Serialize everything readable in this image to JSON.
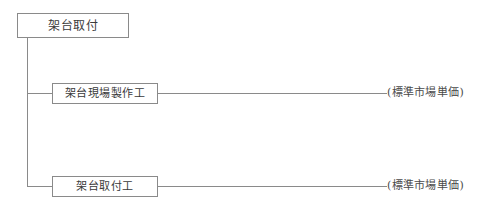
{
  "diagram": {
    "type": "tree",
    "root": {
      "id": "node-root",
      "label": "架台取付"
    },
    "children": [
      {
        "id": "node-fab",
        "label": "架台現場製作工",
        "annotation": "(標準市場単価)"
      },
      {
        "id": "node-install",
        "label": "架台取付工",
        "annotation": "(標準市場単価)"
      }
    ],
    "colors": {
      "box_border": "#8a8a8a",
      "line": "#8a8a8a",
      "text": "#3a3a3a",
      "annotation_text": "#4a4a4a",
      "background": "#ffffff"
    }
  }
}
